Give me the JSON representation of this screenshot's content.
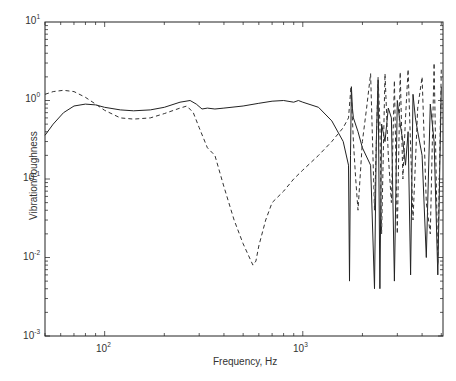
{
  "chart_data": {
    "type": "line",
    "title": "",
    "xlabel": "Frequency, Hz",
    "ylabel": "Vibration/roughness",
    "xscale": "log",
    "yscale": "log",
    "xlim": [
      50,
      5100
    ],
    "ylim": [
      0.001,
      10
    ],
    "x_ticks": [
      {
        "label": "10",
        "exp": "2",
        "value": 100
      },
      {
        "label": "10",
        "exp": "3",
        "value": 1000
      }
    ],
    "y_ticks": [
      {
        "label": "10",
        "exp": "1",
        "value": 10
      },
      {
        "label": "10",
        "exp": "0",
        "value": 1
      },
      {
        "label": "10",
        "exp": "-1",
        "value": 0.1
      },
      {
        "label": "10",
        "exp": "-2",
        "value": 0.01
      },
      {
        "label": "10",
        "exp": "-3",
        "value": 0.001
      }
    ],
    "grid": false,
    "legend": null,
    "series": [
      {
        "name": "solid",
        "style": "solid",
        "x": [
          50,
          55,
          62,
          70,
          80,
          90,
          100,
          120,
          140,
          170,
          200,
          240,
          270,
          290,
          310,
          330,
          360,
          400,
          500,
          600,
          700,
          800,
          900,
          950,
          1000,
          1200,
          1400,
          1600,
          1700,
          1720,
          1740,
          1760,
          1780,
          1800,
          1900,
          2000,
          2200,
          2300,
          2350,
          2400,
          2450,
          2500,
          2600,
          2700,
          2800,
          2900,
          3000,
          3100,
          3200,
          3300,
          3400,
          3500,
          3600,
          3700,
          3800,
          4000,
          4200,
          4400,
          4600,
          4800,
          5000
        ],
        "y": [
          0.36,
          0.5,
          0.7,
          0.85,
          0.9,
          0.88,
          0.82,
          0.76,
          0.74,
          0.76,
          0.82,
          0.95,
          1.0,
          0.9,
          0.78,
          0.8,
          0.78,
          0.8,
          0.85,
          0.92,
          0.98,
          1.0,
          0.95,
          1.0,
          0.95,
          0.82,
          0.55,
          0.3,
          0.15,
          0.005,
          0.2,
          1.5,
          0.8,
          0.6,
          0.4,
          0.25,
          0.15,
          0.004,
          0.3,
          1.8,
          0.004,
          0.5,
          0.3,
          0.8,
          0.6,
          0.005,
          1.0,
          0.5,
          0.3,
          0.15,
          0.4,
          0.006,
          1.2,
          0.6,
          0.4,
          0.2,
          0.01,
          0.9,
          0.3,
          0.006,
          1.5
        ]
      },
      {
        "name": "dashed",
        "style": "dashed",
        "x": [
          50,
          55,
          62,
          70,
          80,
          90,
          100,
          120,
          140,
          170,
          200,
          240,
          260,
          280,
          300,
          330,
          360,
          400,
          450,
          500,
          560,
          580,
          600,
          650,
          700,
          800,
          900,
          1000,
          1200,
          1400,
          1600,
          1700,
          1750,
          1800,
          1850,
          1900,
          2000,
          2100,
          2200,
          2300,
          2400,
          2450,
          2500,
          2600,
          2700,
          2800,
          2900,
          3000,
          3100,
          3200,
          3300,
          3400,
          3600,
          3800,
          4000,
          4200,
          4400,
          4600,
          4800,
          5000
        ],
        "y": [
          1.2,
          1.3,
          1.35,
          1.3,
          1.1,
          0.9,
          0.75,
          0.6,
          0.58,
          0.6,
          0.68,
          0.8,
          0.85,
          0.7,
          0.45,
          0.25,
          0.2,
          0.08,
          0.03,
          0.015,
          0.008,
          0.009,
          0.014,
          0.03,
          0.05,
          0.07,
          0.1,
          0.13,
          0.2,
          0.3,
          0.45,
          0.6,
          1.5,
          0.3,
          0.1,
          0.04,
          0.3,
          0.8,
          2.2,
          0.04,
          2.0,
          0.5,
          0.02,
          2.2,
          0.2,
          0.05,
          1.8,
          0.02,
          2.3,
          0.1,
          0.6,
          2.5,
          0.03,
          0.8,
          2.0,
          0.05,
          0.02,
          3.0,
          0.008,
          2.5
        ]
      }
    ]
  },
  "axes": {
    "xlabel": "Frequency, Hz",
    "ylabel": "Vibration/roughness"
  }
}
